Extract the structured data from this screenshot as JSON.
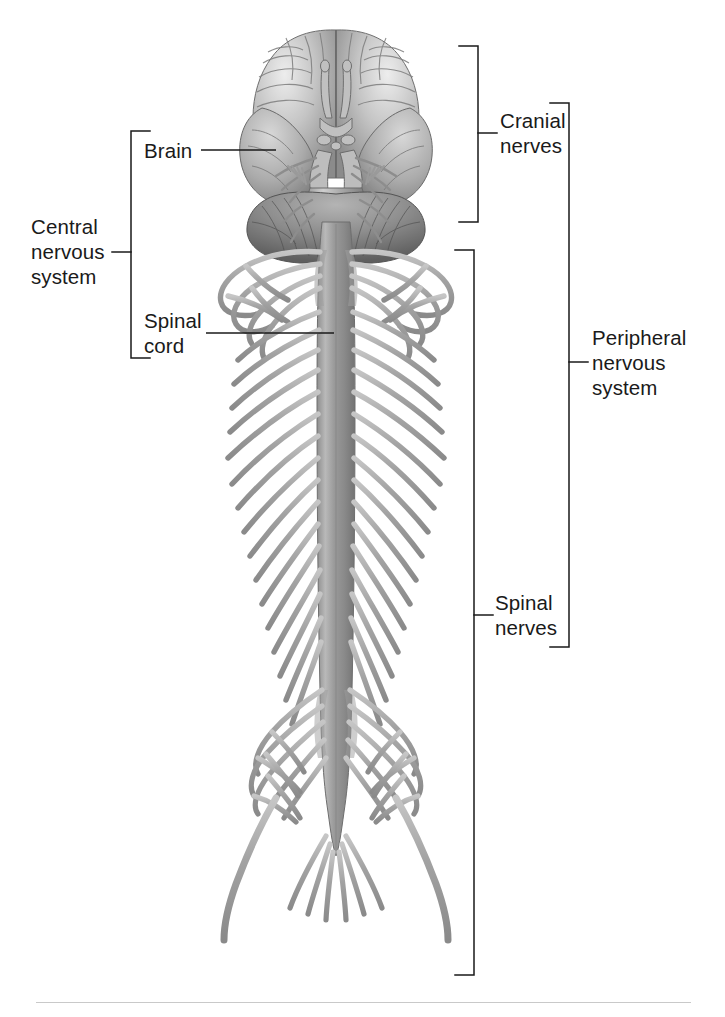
{
  "figure": {
    "view": "inferior view of brain with spinal cord and spinal nerves",
    "background_color": "#ffffff",
    "ink_color": "#1a1a1a",
    "anatomy_fill": "#a8a8a8",
    "anatomy_shadow": "#6d6d6d",
    "anatomy_highlight": "#e2e2e2"
  },
  "labels": {
    "central_nervous_system": "Central\nnervous\nsystem",
    "brain": "Brain",
    "spinal_cord": "Spinal\ncord",
    "cranial_nerves": "Cranial\nnerves",
    "spinal_nerves": "Spinal\nnerves",
    "peripheral_nervous_system": "Peripheral\nnervous\nsystem"
  },
  "structures": {
    "brain": "brain-inferior-view",
    "cerebrum": "cerebral-hemispheres",
    "cerebellum": "cerebellum",
    "brainstem": "brainstem",
    "spinal_cord": "spinal-cord",
    "spinal_nerves": "spinal-nerve-roots",
    "cauda_equina": "cauda-equina",
    "cranial_nerves": "cranial-nerve-bundles"
  },
  "brackets": {
    "cns": {
      "x": 131,
      "top": 131,
      "bottom": 358,
      "tick": 252,
      "side": "left"
    },
    "cranial": {
      "x": 478,
      "top": 46,
      "bottom": 222,
      "tick": 133,
      "side": "right"
    },
    "spinal": {
      "x": 474,
      "top": 250,
      "bottom": 975,
      "tick": 615,
      "side": "right"
    },
    "peripheral": {
      "x": 569,
      "top": 103,
      "bottom": 647,
      "tick": 362,
      "side": "right"
    }
  },
  "leaders": {
    "brain": {
      "x1": 201,
      "x2": 276,
      "y": 150
    },
    "spinal_cord": {
      "x1": 206,
      "x2": 334,
      "y": 333
    }
  },
  "divider": {
    "y": 1002
  }
}
